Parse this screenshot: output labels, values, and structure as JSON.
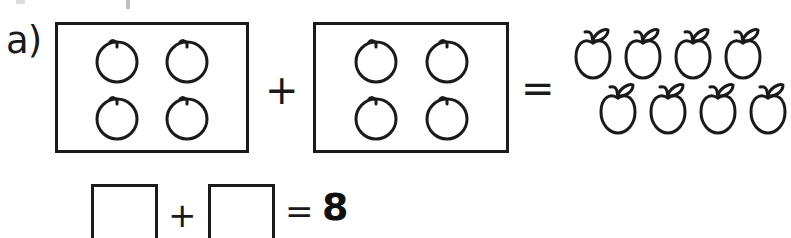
{
  "worksheet": {
    "problem_label": "a)",
    "background_color": "#ffffff",
    "ink_color": "#1a1a1a"
  },
  "equation": {
    "operator_plus": "+",
    "operator_equals": "=",
    "group_1": {
      "name": "first-addend-box",
      "item_icon": "circle-fruit-icon",
      "item_count": 4,
      "items": [
        "circle-fruit",
        "circle-fruit",
        "circle-fruit",
        "circle-fruit"
      ]
    },
    "group_2": {
      "name": "second-addend-box",
      "item_icon": "circle-fruit-icon",
      "item_count": 4,
      "items": [
        "circle-fruit",
        "circle-fruit",
        "circle-fruit",
        "circle-fruit"
      ]
    },
    "result_group": {
      "name": "apple-result-group",
      "item_icon": "apple-icon",
      "item_count": 8,
      "row_top_count": 4,
      "row_bottom_count": 4,
      "row_top": [
        "apple",
        "apple",
        "apple",
        "apple"
      ],
      "row_bottom": [
        "apple",
        "apple",
        "apple",
        "apple"
      ]
    }
  },
  "answer_line": {
    "blank_1_value": "",
    "blank_2_value": "",
    "operator_plus": "+",
    "operator_equals": "=",
    "sum": "8"
  }
}
